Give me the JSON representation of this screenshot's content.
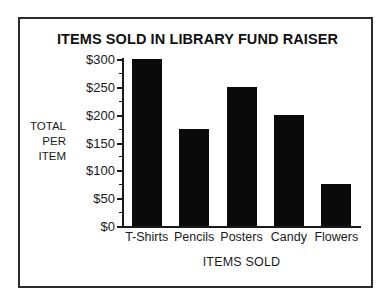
{
  "chart_data": {
    "type": "bar",
    "title": "ITEMS SOLD IN LIBRARY FUND RAISER",
    "xlabel": "ITEMS SOLD",
    "ylabel": "TOTAL PER ITEM",
    "ylabel_lines": [
      "TOTAL",
      "PER",
      "ITEM"
    ],
    "categories": [
      "T-Shirts",
      "Pencils",
      "Posters",
      "Candy",
      "Flowers"
    ],
    "values": [
      300,
      175,
      250,
      200,
      75
    ],
    "ylim": [
      0,
      300
    ],
    "y_major_step": 50,
    "y_minor_step": 25,
    "y_tick_labels": [
      "$0",
      "$50",
      "$100",
      "$150",
      "$200",
      "$250",
      "$300"
    ],
    "y_tick_values": [
      0,
      50,
      100,
      150,
      200,
      250,
      300
    ],
    "grid": false,
    "legend": false,
    "bar_color": "#0a0a0a",
    "background_color": "#ffffff",
    "frame_color": "#2b2b2b"
  }
}
